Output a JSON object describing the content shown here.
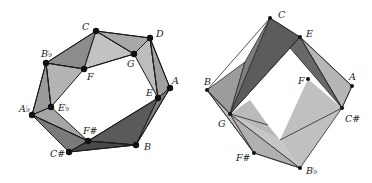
{
  "figures": [
    {
      "id": "left",
      "title": "",
      "vertices": [
        {
          "name": "C",
          "x": 96,
          "y": 31,
          "lx": 82,
          "ly": 30
        },
        {
          "name": "D",
          "x": 150,
          "y": 38,
          "lx": 156,
          "ly": 37
        },
        {
          "name": "G",
          "x": 134,
          "y": 54,
          "lx": 127,
          "ly": 67
        },
        {
          "name": "B♭",
          "x": 46,
          "y": 63,
          "lx": 41,
          "ly": 57
        },
        {
          "name": "F",
          "x": 84,
          "y": 69,
          "lx": 87,
          "ly": 80
        },
        {
          "name": "A",
          "x": 170,
          "y": 88,
          "lx": 172,
          "ly": 84
        },
        {
          "name": "E",
          "x": 158,
          "y": 98,
          "lx": 146,
          "ly": 96
        },
        {
          "name": "A♭",
          "x": 32,
          "y": 115,
          "lx": 19,
          "ly": 112
        },
        {
          "name": "E♭",
          "x": 51,
          "y": 107,
          "lx": 58,
          "ly": 111
        },
        {
          "name": "F#",
          "x": 88,
          "y": 141,
          "lx": 83,
          "ly": 134
        },
        {
          "name": "B",
          "x": 136,
          "y": 145,
          "lx": 144,
          "ly": 150
        },
        {
          "name": "C#",
          "x": 69,
          "y": 152,
          "lx": 50,
          "ly": 157
        }
      ]
    },
    {
      "id": "right",
      "title": "",
      "vertices": [
        {
          "name": "C",
          "x": 270,
          "y": 18,
          "lx": 278,
          "ly": 18
        },
        {
          "name": "E",
          "x": 300,
          "y": 37,
          "lx": 306,
          "ly": 37
        },
        {
          "name": "B",
          "x": 207,
          "y": 90,
          "lx": 204,
          "ly": 85
        },
        {
          "name": "F",
          "x": 308,
          "y": 79,
          "lx": 298,
          "ly": 84
        },
        {
          "name": "A",
          "x": 352,
          "y": 86,
          "lx": 349,
          "ly": 80
        },
        {
          "name": "G",
          "x": 230,
          "y": 114,
          "lx": 218,
          "ly": 127
        },
        {
          "name": "C#",
          "x": 342,
          "y": 108,
          "lx": 345,
          "ly": 122
        },
        {
          "name": "F#",
          "x": 254,
          "y": 153,
          "lx": 236,
          "ly": 161
        },
        {
          "name": "B♭",
          "x": 300,
          "y": 168,
          "lx": 306,
          "ly": 174
        }
      ]
    }
  ],
  "colors": {
    "light": "#c4c4c4",
    "mid": "#a2a2a2",
    "dark": "#6e6e6e",
    "darker": "#4e4e4e",
    "edge": "#1a1a1a",
    "vertex": "#111111"
  }
}
